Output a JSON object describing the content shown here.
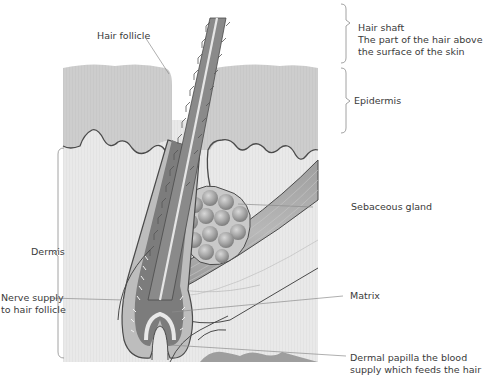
{
  "diagram": {
    "labels": {
      "hair_follicle": "Hair follicle",
      "hair_shaft": {
        "title": "Hair shaft",
        "desc_line1": "The part of the hair above",
        "desc_line2": "the surface of the skin"
      },
      "epidermis": "Epidermis",
      "sebaceous_gland": "Sebaceous gland",
      "dermis": "Dermis",
      "nerve_supply": {
        "line1": "Nerve supply",
        "line2": "to hair follicle"
      },
      "matrix": "Matrix",
      "dermal_papilla": {
        "line1": "Dermal papilla the blood",
        "line2": "supply which feeds the hair"
      }
    },
    "colors": {
      "epidermis": "#cfcfcf",
      "dermis": "#ececec",
      "outline": "#4a4a4a",
      "hair": "#8a8a8a",
      "hair_dark": "#6a6a6a",
      "gland": "#9a9a9a",
      "muscle": "#a8a8a8",
      "leader_line": "#8c8c8c",
      "text": "#3a3a3a"
    }
  }
}
